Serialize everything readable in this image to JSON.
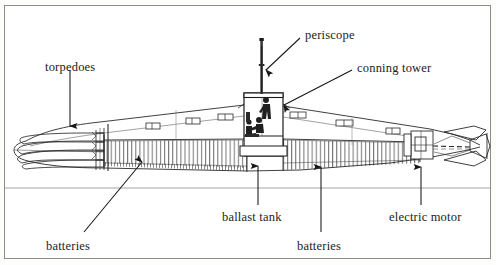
{
  "figure": {
    "view": "side elevation cutaway",
    "background_color": "#ffffff",
    "frame_color": "#8c8c8c",
    "ink_color": "#1b1b1b"
  },
  "labels": {
    "torpedoes": "torpedoes",
    "periscope": "periscope",
    "conning_tower": "conning tower",
    "ballast_tank": "ballast tank",
    "batteries_left": "batteries",
    "batteries_right": "batteries",
    "electric_motor": "electric motor"
  },
  "callouts": [
    {
      "name": "torpedoes",
      "label": "torpedoes",
      "label_x": 45,
      "label_y": 61,
      "arrow_from_x": 70,
      "arrow_from_y": 70,
      "arrow_to_x": 70,
      "arrow_to_y": 128,
      "points_to": "bow torpedo tubes"
    },
    {
      "name": "periscope",
      "label": "periscope",
      "label_x": 305,
      "label_y": 29,
      "arrow_from_x": 300,
      "arrow_from_y": 38,
      "arrow_to_x": 264,
      "arrow_to_y": 72,
      "points_to": "periscope mast"
    },
    {
      "name": "conning-tower",
      "label": "conning tower",
      "label_x": 357,
      "label_y": 62,
      "arrow_from_x": 352,
      "arrow_from_y": 70,
      "arrow_to_x": 281,
      "arrow_to_y": 106,
      "points_to": "conning tower structure"
    },
    {
      "name": "ballast-tank",
      "label": "ballast tank",
      "label_x": 222,
      "label_y": 211,
      "arrow_from_x": 258,
      "arrow_from_y": 205,
      "arrow_to_x": 258,
      "arrow_to_y": 164,
      "points_to": "ballast tank compartment"
    },
    {
      "name": "batteries-left",
      "label": "batteries",
      "label_x": 46,
      "label_y": 240,
      "arrow_from_x": 84,
      "arrow_from_y": 232,
      "arrow_to_x": 143,
      "arrow_to_y": 160,
      "points_to": "forward battery bank"
    },
    {
      "name": "batteries-right",
      "label": "batteries",
      "label_x": 297,
      "label_y": 240,
      "arrow_from_x": 321,
      "arrow_from_y": 232,
      "arrow_to_x": 321,
      "arrow_to_y": 165,
      "points_to": "aft battery bank"
    },
    {
      "name": "electric-motor",
      "label": "electric motor",
      "label_x": 389,
      "label_y": 211,
      "arrow_from_x": 421,
      "arrow_from_y": 205,
      "arrow_to_x": 421,
      "arrow_to_y": 165,
      "points_to": "electric motor at stern"
    }
  ],
  "diagram_parts": [
    {
      "name": "bow-torpedo-tubes",
      "description": "four nested torpedo tube outlines in the bow"
    },
    {
      "name": "pressure-hull",
      "description": "long tapering hull envelope"
    },
    {
      "name": "deck-line",
      "description": "upper deck line running bow to stern"
    },
    {
      "name": "ballast-tank-hatching",
      "description": "vertical hatching band along the lower hull"
    },
    {
      "name": "conning-tower",
      "description": "raised box amidships with crew figures"
    },
    {
      "name": "periscope-mast",
      "description": "vertical mast rising above the conning tower"
    },
    {
      "name": "crew-figures",
      "description": "two seated/standing crew silhouettes inside the conning tower"
    },
    {
      "name": "electric-motor-block",
      "description": "machinery block forward of the stern"
    },
    {
      "name": "drive-shaft",
      "description": "dashed shaft running aft to the propeller"
    },
    {
      "name": "propeller-and-rudder",
      "description": "stern propeller blades and control surfaces"
    },
    {
      "name": "waterline",
      "description": "horizontal rule below the hull"
    }
  ]
}
